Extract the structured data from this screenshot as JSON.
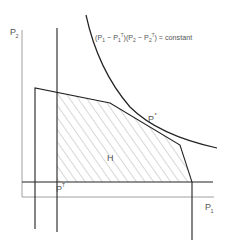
{
  "diagram": {
    "type": "feasible-region-plot",
    "axes": {
      "x_label": "P",
      "x_sub": "1",
      "y_label": "P",
      "y_sub": "2"
    },
    "equation": "(P₁ − P₁ᵀ)(P₂ − P₂ᵀ) = constant",
    "equation_parts": {
      "open1": "(P",
      "sub1": "1",
      "minus1": " − P",
      "sub1b": "1",
      "sup1": "T",
      "mid": ")(P",
      "sub2": "2",
      "minus2": " − P",
      "sub2b": "2",
      "sup2": "T",
      "tail": ") = constant"
    },
    "points": {
      "optimum": {
        "label": "P",
        "sup": "*"
      },
      "threat": {
        "label": "P",
        "sup": "T"
      }
    },
    "region_label": "H",
    "colors": {
      "line": "#222222",
      "axis": "#888888",
      "hatch": "#999999",
      "text": "#555555"
    }
  }
}
